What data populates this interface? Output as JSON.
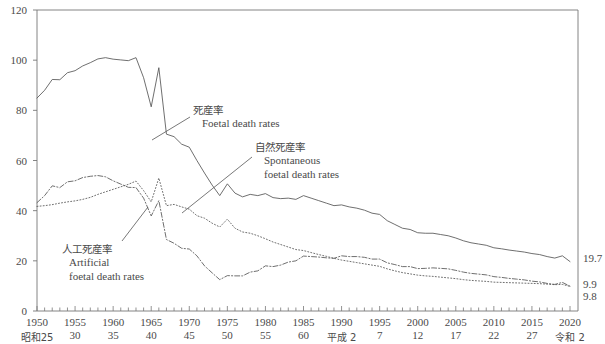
{
  "chart_data": {
    "type": "line",
    "title": "",
    "xlabel": "",
    "ylabel": "",
    "xlim": [
      1950,
      2020
    ],
    "ylim": [
      0,
      120
    ],
    "grid": false,
    "legend_position": "inline-annotations",
    "y_ticks": [
      0,
      20,
      40,
      60,
      80,
      100,
      120
    ],
    "x_ticks": [
      1950,
      1955,
      1960,
      1965,
      1970,
      1975,
      1980,
      1985,
      1990,
      1995,
      2000,
      2005,
      2010,
      2015,
      2020
    ],
    "x_tick_labels": [
      "1950",
      "1955",
      "1960",
      "1965",
      "1970",
      "1975",
      "1980",
      "1985",
      "1990",
      "1995",
      "2000",
      "2005",
      "2010",
      "2015",
      "2020"
    ],
    "x_era_labels": [
      "昭和25",
      "30",
      "35",
      "40",
      "45",
      "50",
      "55",
      "60",
      "平成 2",
      "7",
      "12",
      "17",
      "22",
      "27",
      "令和 2"
    ],
    "x_minor_tick_interval": 1,
    "series": [
      {
        "name": "Foetal death rates",
        "name_jp": "死産率",
        "style": "solid",
        "end_value": 19.7,
        "x": [
          1950,
          1951,
          1952,
          1953,
          1954,
          1955,
          1956,
          1957,
          1958,
          1959,
          1960,
          1961,
          1962,
          1963,
          1964,
          1965,
          1966,
          1967,
          1968,
          1969,
          1970,
          1971,
          1972,
          1973,
          1974,
          1975,
          1976,
          1977,
          1978,
          1979,
          1980,
          1981,
          1982,
          1983,
          1984,
          1985,
          1986,
          1987,
          1988,
          1989,
          1990,
          1991,
          1992,
          1993,
          1994,
          1995,
          1996,
          1997,
          1998,
          1999,
          2000,
          2001,
          2002,
          2003,
          2004,
          2005,
          2006,
          2007,
          2008,
          2009,
          2010,
          2011,
          2012,
          2013,
          2014,
          2015,
          2016,
          2017,
          2018,
          2019,
          2020
        ],
        "values": [
          84.9,
          88.0,
          92.3,
          92.2,
          95.0,
          95.8,
          97.7,
          99.0,
          100.5,
          101.0,
          100.4,
          100.1,
          99.8,
          101.0,
          93.0,
          81.4,
          97.0,
          70.5,
          69.5,
          66.5,
          65.3,
          60.0,
          55.0,
          50.2,
          46.0,
          50.7,
          47.0,
          45.5,
          46.5,
          46.0,
          46.8,
          45.2,
          44.8,
          45.0,
          44.5,
          46.0,
          45.0,
          44.0,
          43.0,
          42.0,
          42.3,
          41.5,
          41.0,
          40.2,
          39.0,
          38.5,
          36.0,
          34.5,
          33.0,
          32.5,
          31.2,
          31.0,
          31.0,
          30.5,
          30.0,
          29.1,
          28.0,
          27.2,
          26.7,
          26.2,
          25.2,
          24.8,
          24.3,
          23.9,
          23.5,
          22.9,
          22.5,
          21.7,
          21.1,
          22.0,
          19.7
        ]
      },
      {
        "name": "Spontaneous foetal death rates",
        "name_jp": "自然死産率",
        "style": "dotted",
        "end_value": 9.8,
        "x": [
          1950,
          1951,
          1952,
          1953,
          1954,
          1955,
          1956,
          1957,
          1958,
          1959,
          1960,
          1961,
          1962,
          1963,
          1964,
          1965,
          1966,
          1967,
          1968,
          1969,
          1970,
          1971,
          1972,
          1973,
          1974,
          1975,
          1976,
          1977,
          1978,
          1979,
          1980,
          1981,
          1982,
          1983,
          1984,
          1985,
          1986,
          1987,
          1988,
          1989,
          1990,
          1991,
          1992,
          1993,
          1994,
          1995,
          1996,
          1997,
          1998,
          1999,
          2000,
          2001,
          2002,
          2003,
          2004,
          2005,
          2006,
          2007,
          2008,
          2009,
          2010,
          2011,
          2012,
          2013,
          2014,
          2015,
          2016,
          2017,
          2018,
          2019,
          2020
        ],
        "values": [
          41.7,
          42.0,
          42.4,
          43.0,
          43.5,
          43.9,
          44.5,
          45.3,
          46.5,
          47.5,
          48.5,
          49.5,
          50.5,
          51.8,
          48.0,
          43.5,
          53.0,
          42.0,
          42.5,
          41.5,
          40.6,
          38.0,
          37.0,
          35.0,
          33.5,
          36.6,
          33.0,
          31.5,
          31.0,
          30.0,
          28.8,
          27.5,
          26.5,
          25.5,
          24.5,
          24.1,
          23.3,
          22.5,
          21.8,
          21.0,
          20.3,
          19.8,
          19.3,
          18.8,
          18.3,
          17.8,
          16.8,
          16.0,
          15.3,
          14.8,
          14.3,
          14.0,
          13.8,
          13.5,
          13.2,
          12.9,
          12.5,
          12.2,
          12.0,
          11.8,
          11.5,
          11.4,
          11.3,
          11.2,
          11.1,
          11.0,
          10.9,
          10.7,
          10.5,
          10.6,
          9.8
        ]
      },
      {
        "name": "Artificial foetal death rates",
        "name_jp": "人工死産率",
        "style": "dash-dot",
        "end_value": 9.9,
        "x": [
          1950,
          1951,
          1952,
          1953,
          1954,
          1955,
          1956,
          1957,
          1958,
          1959,
          1960,
          1961,
          1962,
          1963,
          1964,
          1965,
          1966,
          1967,
          1968,
          1969,
          1970,
          1971,
          1972,
          1973,
          1974,
          1975,
          1976,
          1977,
          1978,
          1979,
          1980,
          1981,
          1982,
          1983,
          1984,
          1985,
          1986,
          1987,
          1988,
          1989,
          1990,
          1991,
          1992,
          1993,
          1994,
          1995,
          1996,
          1997,
          1998,
          1999,
          2000,
          2001,
          2002,
          2003,
          2004,
          2005,
          2006,
          2007,
          2008,
          2009,
          2010,
          2011,
          2012,
          2013,
          2014,
          2015,
          2016,
          2017,
          2018,
          2019,
          2020
        ],
        "values": [
          43.2,
          46.0,
          49.9,
          49.2,
          51.5,
          51.9,
          53.2,
          53.7,
          54.0,
          53.5,
          51.9,
          50.6,
          49.3,
          49.2,
          45.0,
          37.9,
          44.0,
          28.5,
          27.0,
          25.0,
          24.7,
          22.0,
          18.0,
          15.2,
          12.5,
          14.1,
          14.0,
          14.0,
          15.5,
          16.0,
          18.0,
          17.7,
          18.3,
          19.5,
          20.0,
          21.9,
          21.7,
          21.5,
          21.2,
          21.0,
          22.0,
          21.7,
          21.7,
          21.4,
          20.7,
          20.7,
          19.2,
          18.5,
          17.7,
          17.7,
          16.9,
          17.0,
          17.2,
          17.0,
          16.8,
          16.2,
          15.5,
          15.0,
          14.7,
          14.4,
          13.7,
          13.4,
          13.0,
          12.7,
          12.4,
          11.9,
          11.6,
          11.0,
          10.6,
          11.4,
          9.9
        ]
      }
    ],
    "annotations": [
      {
        "id": "foetal",
        "jp": "死産率",
        "en": [
          "Foetal death rates"
        ]
      },
      {
        "id": "spontaneous",
        "jp": "自然死産率",
        "en": [
          "Spontaneous",
          "foetal death rates"
        ]
      },
      {
        "id": "artificial",
        "jp": "人工死産率",
        "en": [
          "Artificial",
          "foetal death rates"
        ]
      }
    ],
    "end_labels": [
      {
        "value": "19.7",
        "series": "Foetal death rates"
      },
      {
        "value": "9.9",
        "series": "Artificial foetal death rates"
      },
      {
        "value": "9.8",
        "series": "Spontaneous foetal death rates"
      }
    ],
    "colors": {
      "line": "#555555",
      "axis": "#777777",
      "text": "#4a4a4a",
      "background": "#ffffff"
    }
  }
}
